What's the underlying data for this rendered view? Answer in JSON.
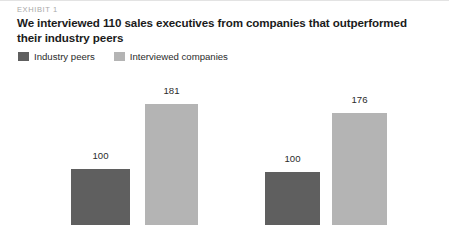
{
  "exhibit": {
    "kicker": "EXHIBIT 1",
    "title": "We interviewed 110 sales executives from companies that outperformed their industry peers"
  },
  "colors": {
    "industry_peers": "#5f5f5f",
    "interviewed_companies": "#b4b4b4",
    "text": "#2b2b2b",
    "kicker": "#a9a9a9",
    "background": "#ffffff",
    "rule": "#e3e3e3"
  },
  "legend": {
    "items": [
      {
        "label": "Industry peers",
        "color": "#5f5f5f"
      },
      {
        "label": "Interviewed companies",
        "color": "#b4b4b4"
      }
    ]
  },
  "chart_data": {
    "type": "bar",
    "title": "We interviewed 110 sales executives from companies that outperformed their industry peers",
    "subtitle": "EXHIBIT 1",
    "xlabel": "",
    "ylabel": "",
    "grid": false,
    "legend_position": "top-left",
    "indexed_to": 100,
    "categories": [
      "Group 1",
      "Group 2"
    ],
    "series": [
      {
        "name": "Industry peers",
        "color": "#5f5f5f",
        "values": [
          100,
          100
        ]
      },
      {
        "name": "Interviewed companies",
        "color": "#b4b4b4",
        "values": [
          181,
          176
        ]
      }
    ],
    "data_labels": [
      {
        "group": 0,
        "series": "Industry peers",
        "value": 100,
        "text": "100"
      },
      {
        "group": 0,
        "series": "Interviewed companies",
        "value": 181,
        "text": "181"
      },
      {
        "group": 1,
        "series": "Industry peers",
        "value": 100,
        "text": "100"
      },
      {
        "group": 1,
        "series": "Interviewed companies",
        "value": 176,
        "text": "176"
      }
    ],
    "ylim": [
      0,
      200
    ],
    "note": "bars are cropped at the bottom edge of the image; no axis line or tick labels are visible"
  },
  "layout": {
    "groups": [
      {
        "left": 63,
        "width": 143,
        "bars": [
          {
            "series": 0,
            "left": 8,
            "width": 59,
            "top": 97,
            "label_top": 78,
            "value_text": "100"
          },
          {
            "series": 1,
            "left": 82,
            "width": 53,
            "top": 32,
            "label_top": 13,
            "value_text": "181"
          }
        ]
      },
      {
        "left": 257,
        "width": 140,
        "bars": [
          {
            "series": 0,
            "left": 8,
            "width": 55,
            "top": 100,
            "label_top": 81,
            "value_text": "100"
          },
          {
            "series": 1,
            "left": 75,
            "width": 55,
            "top": 41,
            "label_top": 22,
            "value_text": "176"
          }
        ]
      }
    ]
  }
}
